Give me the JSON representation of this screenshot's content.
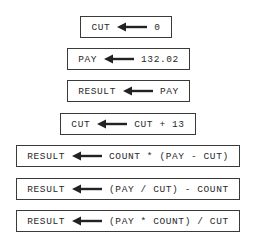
{
  "assignments": [
    {
      "target": "CUT",
      "expression": "0"
    },
    {
      "target": "PAY",
      "expression": "132.02"
    },
    {
      "target": "RESULT",
      "expression": "PAY"
    },
    {
      "target": "CUT",
      "expression": "CUT + 13"
    },
    {
      "target": "RESULT",
      "expression": "COUNT * (PAY - CUT)"
    },
    {
      "target": "RESULT",
      "expression": "(PAY / CUT) - COUNT"
    },
    {
      "target": "RESULT",
      "expression": "(PAY * COUNT) / CUT"
    }
  ],
  "arrow_icon": "left-arrow"
}
